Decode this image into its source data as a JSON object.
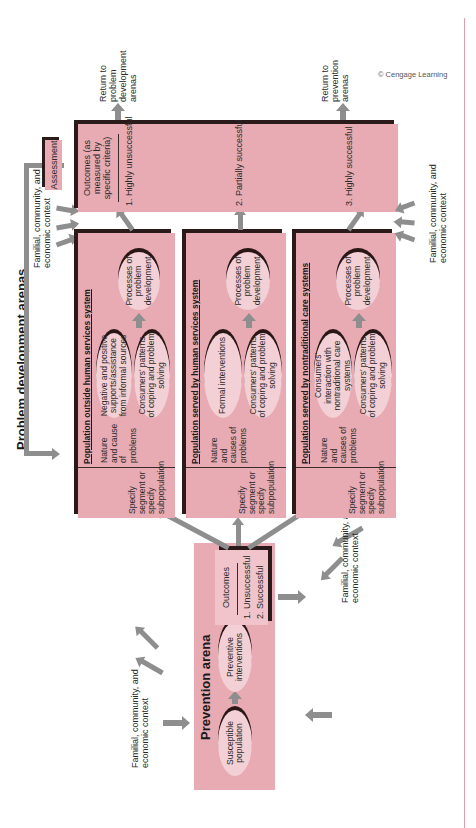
{
  "diagram": {
    "orientation": "rotated-90-ccw",
    "colors": {
      "box_fill": "#e8aab3",
      "ellipse_fill": "#f3d0d5",
      "shadow": "#2a1a1a",
      "arrow": "#8e8e8e",
      "frame_line": "#e0a0aa"
    },
    "prevention": {
      "title": "Prevention arena",
      "nodes": [
        "Susceptible population",
        "Preventive interventions"
      ],
      "outcomes": {
        "heading": "Outcomes",
        "items": [
          "1. Unsuccessful",
          "2. Successful"
        ]
      },
      "context_left": "Familial, community, and economic context",
      "context_right": "Familial, community, and economic context"
    },
    "problem_development": {
      "title": "Problem development arenas",
      "rows": [
        {
          "title": "Population outside human services system",
          "segment": "Specify segment or specify subpopulation",
          "nature": "Nature and cause of problems",
          "middle_top": "Negative and positive supports/assistance from informal sources",
          "middle_bottom": "Consumers' patterns of coping and problem solving",
          "processes": "Processes of problem development"
        },
        {
          "title": "Population served by human services system",
          "segment": "Specify segment or specify subpopulation",
          "nature": "Nature and causes of problems",
          "middle_top": "Formal interventions",
          "middle_bottom": "Consumers' patterns of coping and problem solving",
          "processes": "Processes of problem development"
        },
        {
          "title": "Population served by nontraditional care systems",
          "segment": "Specify segment or specify subpopulation",
          "nature": "Nature and causes of problems",
          "middle_top": "Consumers' interaction with nontraditional care systems",
          "middle_bottom": "Consumers' patterns of coping and problem solving",
          "processes": "Processes of problem development"
        }
      ]
    },
    "outcomes": {
      "heading": "Outcomes (as measured by specific criteria)",
      "items": [
        "1. Highly unsuccessful",
        "2. Partially successful",
        "3. Highly successful"
      ],
      "return_top": "Return to problem development arenas",
      "return_bottom": "Return to prevention arenas"
    },
    "assessment": "Assessment",
    "context_top": "Familial, community, and economic context",
    "context_bottom": "Familial, community, and economic context",
    "copyright": "© Cengage Learning"
  }
}
